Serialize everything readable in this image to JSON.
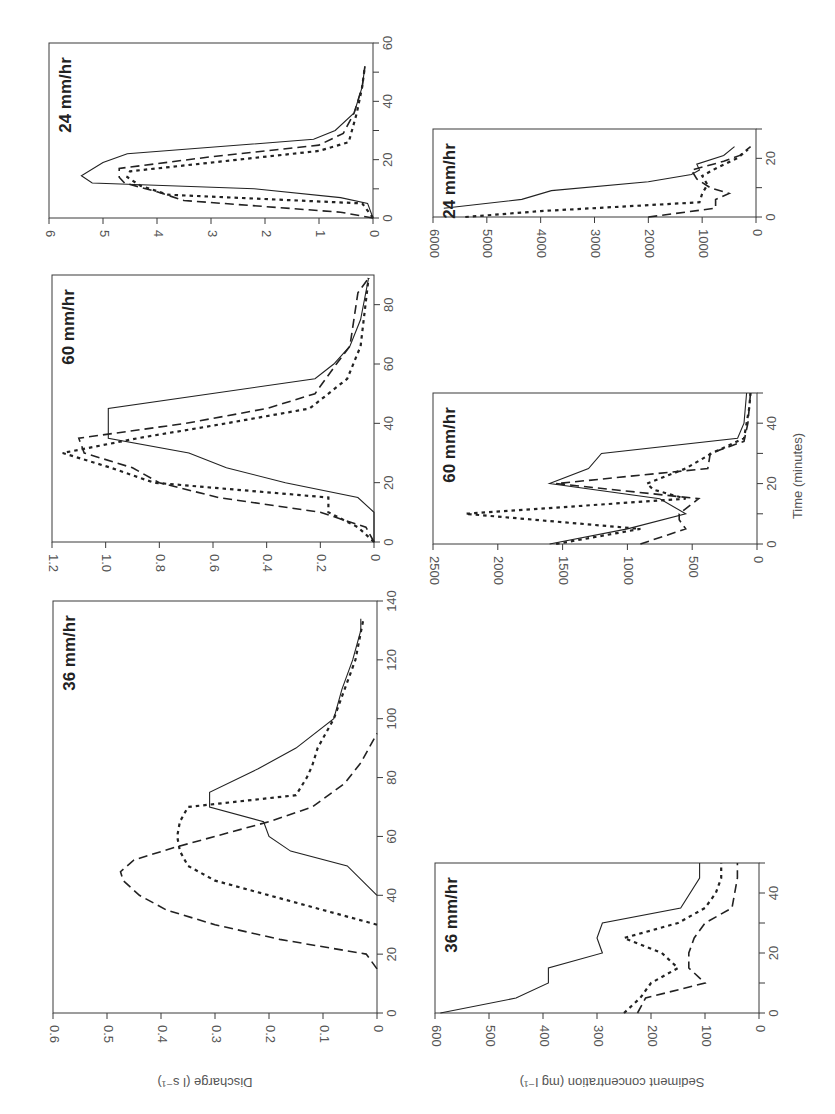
{
  "figure": {
    "orientation": "rotated 90 degrees",
    "discharge_axis_label": "Discharge (l s⁻¹)",
    "sediment_axis_label": "Sediment concentration (mg l⁻¹)",
    "time_axis_label": "Time (minutes)",
    "series_styles": [
      "solid",
      "long-dashed",
      "dotted"
    ]
  },
  "chart_data": [
    {
      "type": "line",
      "title": "24 mm/hr",
      "ylabel": "Discharge (l s-1)",
      "xlabel": "Time (minutes)",
      "xlim": [
        0,
        60
      ],
      "ylim": [
        0,
        6
      ],
      "xticks": [
        "0",
        "20",
        "40",
        "60"
      ],
      "yticks": [
        "0",
        "1",
        "2",
        "3",
        "4",
        "5",
        "6"
      ],
      "frame": {
        "left": 49,
        "right": 373,
        "top": 43,
        "bottom": 218
      },
      "series": [
        {
          "name": "solid",
          "style": "solid",
          "points": [
            [
              0,
              0
            ],
            [
              5,
              0.1
            ],
            [
              7,
              0.6
            ],
            [
              10,
              2.2
            ],
            [
              12,
              5.2
            ],
            [
              14.5,
              5.4
            ],
            [
              19,
              5.0
            ],
            [
              22,
              4.55
            ],
            [
              27,
              1.1
            ],
            [
              30,
              0.7
            ],
            [
              36,
              0.35
            ],
            [
              45,
              0.2
            ],
            [
              52,
              0.15
            ]
          ]
        },
        {
          "name": "dashed",
          "style": "dashed",
          "points": [
            [
              0,
              0
            ],
            [
              2,
              0.6
            ],
            [
              6,
              3.5
            ],
            [
              9,
              4.0
            ],
            [
              12,
              4.6
            ],
            [
              14,
              4.7
            ],
            [
              17,
              4.7
            ],
            [
              21,
              3.0
            ],
            [
              25,
              1.0
            ],
            [
              29,
              0.55
            ],
            [
              36,
              0.35
            ],
            [
              45,
              0.2
            ],
            [
              52,
              0.15
            ]
          ]
        },
        {
          "name": "dotted",
          "style": "dotted",
          "points": [
            [
              0,
              0
            ],
            [
              5,
              0.2
            ],
            [
              8,
              3.8
            ],
            [
              11,
              4.3
            ],
            [
              14,
              4.55
            ],
            [
              16,
              4.5
            ],
            [
              19,
              3.0
            ],
            [
              23,
              1.0
            ],
            [
              26,
              0.45
            ],
            [
              36,
              0.3
            ],
            [
              45,
              0.2
            ],
            [
              52,
              0.15
            ]
          ]
        }
      ]
    },
    {
      "type": "line",
      "title": "60 mm/hr",
      "ylabel": "Discharge (l s-1)",
      "xlabel": "Time (minutes)",
      "xlim": [
        0,
        90
      ],
      "ylim": [
        0,
        1.2
      ],
      "xticks": [
        "0",
        "20",
        "40",
        "60",
        "80"
      ],
      "yticks": [
        "0",
        "0.2",
        "0.4",
        "0.6",
        "0.8",
        "1.0",
        "1.2"
      ],
      "frame": {
        "left": 52,
        "right": 374,
        "top": 275,
        "bottom": 542
      },
      "series": [
        {
          "name": "solid",
          "style": "solid",
          "points": [
            [
              0,
              0
            ],
            [
              10,
              0
            ],
            [
              15,
              0.06
            ],
            [
              20,
              0.33
            ],
            [
              25,
              0.55
            ],
            [
              30,
              0.69
            ],
            [
              35,
              0.99
            ],
            [
              45,
              0.99
            ],
            [
              55,
              0.22
            ],
            [
              60,
              0.15
            ],
            [
              66,
              0.09
            ],
            [
              75,
              0.05
            ],
            [
              89,
              0.02
            ]
          ]
        },
        {
          "name": "dashed",
          "style": "dashed",
          "points": [
            [
              0,
              0
            ],
            [
              5,
              0.03
            ],
            [
              10,
              0.2
            ],
            [
              15,
              0.58
            ],
            [
              20,
              0.8
            ],
            [
              25,
              0.9
            ],
            [
              30,
              1.08
            ],
            [
              35,
              1.1
            ],
            [
              40,
              0.7
            ],
            [
              45,
              0.4
            ],
            [
              50,
              0.22
            ],
            [
              60,
              0.14
            ],
            [
              66,
              0.09
            ],
            [
              84,
              0.06
            ],
            [
              89,
              0.02
            ]
          ]
        },
        {
          "name": "dotted",
          "style": "dotted",
          "points": [
            [
              0,
              0
            ],
            [
              5,
              0.06
            ],
            [
              10,
              0.17
            ],
            [
              15,
              0.17
            ],
            [
              20,
              0.82
            ],
            [
              25,
              0.98
            ],
            [
              30,
              1.16
            ],
            [
              35,
              0.88
            ],
            [
              40,
              0.55
            ],
            [
              45,
              0.24
            ],
            [
              55,
              0.1
            ],
            [
              66,
              0.05
            ],
            [
              89,
              0.02
            ]
          ]
        }
      ]
    },
    {
      "type": "line",
      "title": "36 mm/hr",
      "ylabel": "Discharge (l s-1)",
      "xlabel": "Time (minutes)",
      "xlim": [
        0,
        140
      ],
      "ylim": [
        0,
        0.6
      ],
      "xticks": [
        "0",
        "20",
        "40",
        "60",
        "80",
        "100",
        "120",
        "140"
      ],
      "yticks": [
        "0",
        "0.1",
        "0.2",
        "0.3",
        "0.4",
        "0.5",
        "0.6"
      ],
      "frame": {
        "left": 53,
        "right": 377,
        "top": 601,
        "bottom": 1013
      },
      "series": [
        {
          "name": "solid",
          "style": "solid",
          "points": [
            [
              40,
              0
            ],
            [
              50,
              0.055
            ],
            [
              55,
              0.16
            ],
            [
              60,
              0.2
            ],
            [
              65,
              0.21
            ],
            [
              70,
              0.31
            ],
            [
              75,
              0.31
            ],
            [
              83,
              0.22
            ],
            [
              90,
              0.15
            ],
            [
              100,
              0.08
            ],
            [
              110,
              0.065
            ],
            [
              120,
              0.045
            ],
            [
              130,
              0.03
            ],
            [
              134,
              0.03
            ]
          ]
        },
        {
          "name": "dashed",
          "style": "dashed",
          "points": [
            [
              15,
              0
            ],
            [
              20,
              0.02
            ],
            [
              25,
              0.18
            ],
            [
              30,
              0.3
            ],
            [
              35,
              0.39
            ],
            [
              40,
              0.44
            ],
            [
              45,
              0.47
            ],
            [
              48,
              0.475
            ],
            [
              52,
              0.45
            ],
            [
              56,
              0.38
            ],
            [
              60,
              0.3
            ],
            [
              65,
              0.2
            ],
            [
              70,
              0.12
            ],
            [
              78,
              0.06
            ],
            [
              85,
              0.03
            ],
            [
              95,
              0
            ]
          ]
        },
        {
          "name": "dotted",
          "style": "dotted",
          "points": [
            [
              30,
              0
            ],
            [
              35,
              0.1
            ],
            [
              40,
              0.2
            ],
            [
              45,
              0.3
            ],
            [
              50,
              0.35
            ],
            [
              55,
              0.365
            ],
            [
              60,
              0.37
            ],
            [
              65,
              0.365
            ],
            [
              70,
              0.35
            ],
            [
              74,
              0.15
            ],
            [
              80,
              0.13
            ],
            [
              84,
              0.12
            ],
            [
              90,
              0.11
            ],
            [
              100,
              0.08
            ],
            [
              110,
              0.06
            ],
            [
              120,
              0.04
            ],
            [
              134,
              0.025
            ]
          ]
        }
      ]
    },
    {
      "type": "line",
      "title": "24 mm/hr",
      "ylabel": "Sediment concentration (mg l-1)",
      "xlabel": "Time (minutes)",
      "xlim": [
        0,
        30
      ],
      "ylim": [
        0,
        6000
      ],
      "xticks": [
        "0",
        "20"
      ],
      "yticks": [
        "0",
        "1000",
        "2000",
        "3000",
        "4000",
        "5000",
        "6000"
      ],
      "frame": {
        "left": 433,
        "right": 756,
        "top": 129,
        "bottom": 217
      },
      "series": [
        {
          "name": "solid",
          "style": "solid",
          "points": [
            [
              3,
              5800
            ],
            [
              6,
              4350
            ],
            [
              9,
              3800
            ],
            [
              12,
              2000
            ],
            [
              14.5,
              1200
            ],
            [
              16,
              1050
            ],
            [
              18,
              1100
            ],
            [
              21,
              600
            ],
            [
              24,
              400
            ]
          ]
        },
        {
          "name": "dashed",
          "style": "dashed",
          "points": [
            [
              0,
              2000
            ],
            [
              3,
              750
            ],
            [
              6,
              750
            ],
            [
              8,
              500
            ],
            [
              10,
              850
            ],
            [
              13,
              1100
            ],
            [
              16,
              1200
            ],
            [
              19,
              600
            ],
            [
              21,
              300
            ],
            [
              24,
              100
            ]
          ]
        },
        {
          "name": "dotted",
          "style": "dotted",
          "points": [
            [
              0,
              5400
            ],
            [
              2,
              4000
            ],
            [
              5,
              1050
            ],
            [
              8,
              1000
            ],
            [
              11,
              900
            ],
            [
              14,
              1000
            ],
            [
              17,
              700
            ],
            [
              20,
              350
            ],
            [
              23,
              150
            ]
          ]
        }
      ]
    },
    {
      "type": "line",
      "title": "60 mm/hr",
      "ylabel": "Sediment concentration (mg l-1)",
      "xlabel": "Time (minutes)",
      "xlim": [
        0,
        50
      ],
      "ylim": [
        0,
        2500
      ],
      "xticks": [
        "0",
        "20",
        "40"
      ],
      "yticks": [
        "0",
        "500",
        "1000",
        "1500",
        "2000",
        "2500"
      ],
      "frame": {
        "left": 433,
        "right": 757,
        "top": 393,
        "bottom": 544
      },
      "series": [
        {
          "name": "solid",
          "style": "solid",
          "points": [
            [
              0,
              1600
            ],
            [
              5,
              1000
            ],
            [
              10,
              550
            ],
            [
              15,
              750
            ],
            [
              20,
              1600
            ],
            [
              25,
              1300
            ],
            [
              30,
              1200
            ],
            [
              35,
              150
            ],
            [
              40,
              100
            ],
            [
              50,
              80
            ]
          ]
        },
        {
          "name": "dashed",
          "style": "dashed",
          "points": [
            [
              0,
              900
            ],
            [
              5,
              550
            ],
            [
              8,
              600
            ],
            [
              10,
              600
            ],
            [
              15,
              450
            ],
            [
              20,
              1550
            ],
            [
              25,
              380
            ],
            [
              30,
              360
            ],
            [
              34,
              100
            ],
            [
              40,
              70
            ],
            [
              50,
              50
            ]
          ]
        },
        {
          "name": "dotted",
          "style": "dotted",
          "points": [
            [
              0,
              1550
            ],
            [
              5,
              900
            ],
            [
              10,
              2250
            ],
            [
              15,
              550
            ],
            [
              18,
              800
            ],
            [
              20,
              850
            ],
            [
              25,
              550
            ],
            [
              30,
              350
            ],
            [
              35,
              100
            ],
            [
              45,
              60
            ],
            [
              50,
              50
            ]
          ]
        }
      ]
    },
    {
      "type": "line",
      "title": "36 mm/hr",
      "ylabel": "Sediment concentration (mg l-1)",
      "xlabel": "Time (minutes)",
      "xlim": [
        0,
        50
      ],
      "ylim": [
        0,
        600
      ],
      "xticks": [
        "0",
        "20",
        "40"
      ],
      "yticks": [
        "0",
        "100",
        "200",
        "300",
        "400",
        "500",
        "600"
      ],
      "frame": {
        "left": 435,
        "right": 759,
        "top": 863,
        "bottom": 1013
      },
      "series": [
        {
          "name": "solid",
          "style": "solid",
          "points": [
            [
              0,
              590
            ],
            [
              5,
              450
            ],
            [
              10,
              390
            ],
            [
              15,
              390
            ],
            [
              20,
              290
            ],
            [
              25,
              300
            ],
            [
              30,
              290
            ],
            [
              35,
              145
            ],
            [
              45,
              110
            ],
            [
              50,
              110
            ]
          ]
        },
        {
          "name": "dashed",
          "style": "dashed",
          "points": [
            [
              0,
              225
            ],
            [
              5,
              210
            ],
            [
              10,
              100
            ],
            [
              15,
              130
            ],
            [
              20,
              130
            ],
            [
              25,
              120
            ],
            [
              30,
              100
            ],
            [
              35,
              50
            ],
            [
              45,
              40
            ],
            [
              50,
              40
            ]
          ]
        },
        {
          "name": "dotted",
          "style": "dotted",
          "points": [
            [
              0,
              250
            ],
            [
              5,
              220
            ],
            [
              10,
              200
            ],
            [
              15,
              150
            ],
            [
              20,
              180
            ],
            [
              25,
              250
            ],
            [
              30,
              150
            ],
            [
              35,
              100
            ],
            [
              40,
              80
            ],
            [
              45,
              70
            ],
            [
              50,
              70
            ]
          ]
        }
      ]
    }
  ]
}
